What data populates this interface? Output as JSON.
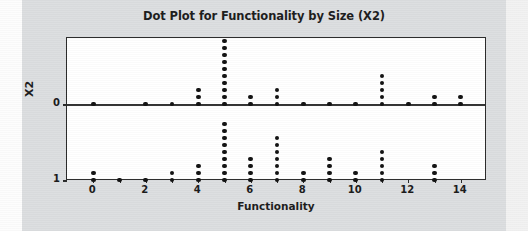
{
  "colors": {
    "panel_background": "#dcdee0",
    "plot_background": "#ffffff",
    "frame": "#2a2a2a",
    "dot": "#111111",
    "text": "#1c1c1c"
  },
  "chart_data": {
    "type": "scatter",
    "title": "Dot Plot for Functionality by Size (X2)",
    "xlabel": "Functionality",
    "ylabel": "X2",
    "grid": false,
    "legend": null,
    "xlim": [
      -1,
      15
    ],
    "ylim": [
      0,
      1
    ],
    "x_ticks": [
      0,
      1,
      2,
      3,
      4,
      5,
      6,
      7,
      8,
      9,
      10,
      11,
      12,
      13,
      14
    ],
    "x_tick_labels": [
      "0",
      "",
      "2",
      "",
      "4",
      "",
      "6",
      "",
      "8",
      "",
      "10",
      "",
      "12",
      "",
      "14"
    ],
    "y_ticks": [
      0,
      1
    ],
    "y_tick_labels": [
      "0",
      "1"
    ],
    "categories": [
      0,
      1,
      2,
      3,
      4,
      5,
      6,
      7,
      8,
      9,
      10,
      11,
      12,
      13,
      14
    ],
    "series": [
      {
        "name": "X2 = 0",
        "values": [
          1,
          0,
          1,
          1,
          3,
          10,
          2,
          3,
          1,
          1,
          1,
          5,
          1,
          2,
          2
        ]
      },
      {
        "name": "X2 = 1",
        "values": [
          2,
          1,
          1,
          2,
          3,
          9,
          4,
          7,
          2,
          4,
          2,
          5,
          0,
          3,
          0
        ]
      }
    ]
  }
}
